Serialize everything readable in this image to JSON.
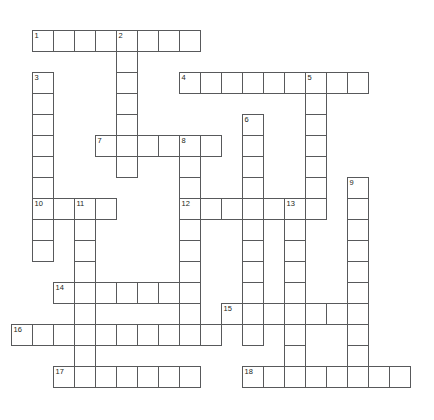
{
  "puzzle": {
    "type": "crossword-grid",
    "title": "",
    "cell_size_px": 22,
    "grid_origin": {
      "x": 11,
      "y": 9
    },
    "colors": {
      "cell_border": "#58595b",
      "cell_fill": "#ffffff",
      "number_text": "#231f20",
      "page_background": "#ffffff"
    },
    "entries": [
      {
        "number": "1",
        "direction": "across",
        "col": 1,
        "row": 1,
        "length": 8
      },
      {
        "number": "2",
        "direction": "down",
        "col": 5,
        "row": 1,
        "length": 8
      },
      {
        "number": "3",
        "direction": "down",
        "col": 1,
        "row": 3,
        "length": 7
      },
      {
        "number": "4",
        "direction": "across",
        "col": 8,
        "row": 3,
        "length": 9
      },
      {
        "number": "5",
        "direction": "down",
        "col": 14,
        "row": 3,
        "length": 7
      },
      {
        "number": "6",
        "direction": "down",
        "col": 11,
        "row": 5,
        "length": 10
      },
      {
        "number": "7",
        "direction": "across",
        "col": 4,
        "row": 6,
        "length": 6
      },
      {
        "number": "8",
        "direction": "down",
        "col": 8,
        "row": 6,
        "length": 9
      },
      {
        "number": "9",
        "direction": "down",
        "col": 16,
        "row": 8,
        "length": 9
      },
      {
        "number": "10",
        "direction": "across",
        "col": 1,
        "row": 9,
        "length": 4
      },
      {
        "number": "11",
        "direction": "down",
        "col": 3,
        "row": 9,
        "length": 9
      },
      {
        "number": "12",
        "direction": "across",
        "col": 8,
        "row": 9,
        "length": 6
      },
      {
        "number": "13",
        "direction": "down",
        "col": 13,
        "row": 9,
        "length": 7
      },
      {
        "number": "14",
        "direction": "across",
        "col": 2,
        "row": 13,
        "length": 7
      },
      {
        "number": "15",
        "direction": "across",
        "col": 10,
        "row": 14,
        "length": 7
      },
      {
        "number": "16",
        "direction": "across",
        "col": 0,
        "row": 15,
        "length": 10
      },
      {
        "number": "17",
        "direction": "across",
        "col": 2,
        "row": 17,
        "length": 7
      },
      {
        "number": "18",
        "direction": "across",
        "col": 11,
        "row": 17,
        "length": 8
      }
    ],
    "cells": [
      {
        "col": 1,
        "row": 1,
        "number": "1",
        "letter": ""
      },
      {
        "col": 2,
        "row": 1,
        "number": "",
        "letter": ""
      },
      {
        "col": 3,
        "row": 1,
        "number": "",
        "letter": ""
      },
      {
        "col": 4,
        "row": 1,
        "number": "",
        "letter": ""
      },
      {
        "col": 5,
        "row": 1,
        "number": "2",
        "letter": ""
      },
      {
        "col": 6,
        "row": 1,
        "number": "",
        "letter": ""
      },
      {
        "col": 7,
        "row": 1,
        "number": "",
        "letter": ""
      },
      {
        "col": 8,
        "row": 1,
        "number": "",
        "letter": ""
      },
      {
        "col": 5,
        "row": 2,
        "number": "",
        "letter": ""
      },
      {
        "col": 1,
        "row": 3,
        "number": "3",
        "letter": ""
      },
      {
        "col": 5,
        "row": 3,
        "number": "",
        "letter": ""
      },
      {
        "col": 8,
        "row": 3,
        "number": "4",
        "letter": ""
      },
      {
        "col": 9,
        "row": 3,
        "number": "",
        "letter": ""
      },
      {
        "col": 10,
        "row": 3,
        "number": "",
        "letter": ""
      },
      {
        "col": 11,
        "row": 3,
        "number": "",
        "letter": ""
      },
      {
        "col": 12,
        "row": 3,
        "number": "",
        "letter": ""
      },
      {
        "col": 13,
        "row": 3,
        "number": "",
        "letter": ""
      },
      {
        "col": 14,
        "row": 3,
        "number": "5",
        "letter": ""
      },
      {
        "col": 15,
        "row": 3,
        "number": "",
        "letter": ""
      },
      {
        "col": 16,
        "row": 3,
        "number": "",
        "letter": ""
      },
      {
        "col": 1,
        "row": 4,
        "number": "",
        "letter": ""
      },
      {
        "col": 5,
        "row": 4,
        "number": "",
        "letter": ""
      },
      {
        "col": 14,
        "row": 4,
        "number": "",
        "letter": ""
      },
      {
        "col": 1,
        "row": 5,
        "number": "",
        "letter": ""
      },
      {
        "col": 5,
        "row": 5,
        "number": "",
        "letter": ""
      },
      {
        "col": 11,
        "row": 5,
        "number": "6",
        "letter": ""
      },
      {
        "col": 14,
        "row": 5,
        "number": "",
        "letter": ""
      },
      {
        "col": 1,
        "row": 6,
        "number": "",
        "letter": ""
      },
      {
        "col": 4,
        "row": 6,
        "number": "7",
        "letter": ""
      },
      {
        "col": 5,
        "row": 6,
        "number": "",
        "letter": ""
      },
      {
        "col": 6,
        "row": 6,
        "number": "",
        "letter": ""
      },
      {
        "col": 7,
        "row": 6,
        "number": "",
        "letter": ""
      },
      {
        "col": 8,
        "row": 6,
        "number": "8",
        "letter": ""
      },
      {
        "col": 9,
        "row": 6,
        "number": "",
        "letter": ""
      },
      {
        "col": 11,
        "row": 6,
        "number": "",
        "letter": ""
      },
      {
        "col": 14,
        "row": 6,
        "number": "",
        "letter": ""
      },
      {
        "col": 1,
        "row": 7,
        "number": "",
        "letter": ""
      },
      {
        "col": 5,
        "row": 7,
        "number": "",
        "letter": ""
      },
      {
        "col": 8,
        "row": 7,
        "number": "",
        "letter": ""
      },
      {
        "col": 11,
        "row": 7,
        "number": "",
        "letter": ""
      },
      {
        "col": 14,
        "row": 7,
        "number": "",
        "letter": ""
      },
      {
        "col": 1,
        "row": 8,
        "number": "",
        "letter": ""
      },
      {
        "col": 8,
        "row": 8,
        "number": "",
        "letter": ""
      },
      {
        "col": 11,
        "row": 8,
        "number": "",
        "letter": ""
      },
      {
        "col": 14,
        "row": 8,
        "number": "",
        "letter": ""
      },
      {
        "col": 16,
        "row": 8,
        "number": "9",
        "letter": ""
      },
      {
        "col": 1,
        "row": 9,
        "number": "10",
        "letter": ""
      },
      {
        "col": 2,
        "row": 9,
        "number": "",
        "letter": ""
      },
      {
        "col": 3,
        "row": 9,
        "number": "11",
        "letter": ""
      },
      {
        "col": 4,
        "row": 9,
        "number": "",
        "letter": ""
      },
      {
        "col": 8,
        "row": 9,
        "number": "12",
        "letter": ""
      },
      {
        "col": 9,
        "row": 9,
        "number": "",
        "letter": ""
      },
      {
        "col": 10,
        "row": 9,
        "number": "",
        "letter": ""
      },
      {
        "col": 11,
        "row": 9,
        "number": "",
        "letter": ""
      },
      {
        "col": 12,
        "row": 9,
        "number": "",
        "letter": ""
      },
      {
        "col": 13,
        "row": 9,
        "number": "13",
        "letter": ""
      },
      {
        "col": 14,
        "row": 9,
        "number": "",
        "letter": ""
      },
      {
        "col": 16,
        "row": 9,
        "number": "",
        "letter": ""
      },
      {
        "col": 1,
        "row": 10,
        "number": "",
        "letter": ""
      },
      {
        "col": 3,
        "row": 10,
        "number": "",
        "letter": ""
      },
      {
        "col": 8,
        "row": 10,
        "number": "",
        "letter": ""
      },
      {
        "col": 11,
        "row": 10,
        "number": "",
        "letter": ""
      },
      {
        "col": 13,
        "row": 10,
        "number": "",
        "letter": ""
      },
      {
        "col": 16,
        "row": 10,
        "number": "",
        "letter": ""
      },
      {
        "col": 1,
        "row": 11,
        "number": "",
        "letter": ""
      },
      {
        "col": 3,
        "row": 11,
        "number": "",
        "letter": ""
      },
      {
        "col": 8,
        "row": 11,
        "number": "",
        "letter": ""
      },
      {
        "col": 11,
        "row": 11,
        "number": "",
        "letter": ""
      },
      {
        "col": 13,
        "row": 11,
        "number": "",
        "letter": ""
      },
      {
        "col": 16,
        "row": 11,
        "number": "",
        "letter": ""
      },
      {
        "col": 3,
        "row": 12,
        "number": "",
        "letter": ""
      },
      {
        "col": 8,
        "row": 12,
        "number": "",
        "letter": ""
      },
      {
        "col": 11,
        "row": 12,
        "number": "",
        "letter": ""
      },
      {
        "col": 13,
        "row": 12,
        "number": "",
        "letter": ""
      },
      {
        "col": 16,
        "row": 12,
        "number": "",
        "letter": ""
      },
      {
        "col": 2,
        "row": 13,
        "number": "14",
        "letter": ""
      },
      {
        "col": 3,
        "row": 13,
        "number": "",
        "letter": ""
      },
      {
        "col": 4,
        "row": 13,
        "number": "",
        "letter": ""
      },
      {
        "col": 5,
        "row": 13,
        "number": "",
        "letter": ""
      },
      {
        "col": 6,
        "row": 13,
        "number": "",
        "letter": ""
      },
      {
        "col": 7,
        "row": 13,
        "number": "",
        "letter": ""
      },
      {
        "col": 8,
        "row": 13,
        "number": "",
        "letter": ""
      },
      {
        "col": 11,
        "row": 13,
        "number": "",
        "letter": ""
      },
      {
        "col": 13,
        "row": 13,
        "number": "",
        "letter": ""
      },
      {
        "col": 16,
        "row": 13,
        "number": "",
        "letter": ""
      },
      {
        "col": 3,
        "row": 14,
        "number": "",
        "letter": ""
      },
      {
        "col": 8,
        "row": 14,
        "number": "",
        "letter": ""
      },
      {
        "col": 10,
        "row": 14,
        "number": "15",
        "letter": ""
      },
      {
        "col": 11,
        "row": 14,
        "number": "",
        "letter": ""
      },
      {
        "col": 12,
        "row": 14,
        "number": "",
        "letter": ""
      },
      {
        "col": 13,
        "row": 14,
        "number": "",
        "letter": ""
      },
      {
        "col": 14,
        "row": 14,
        "number": "",
        "letter": ""
      },
      {
        "col": 15,
        "row": 14,
        "number": "",
        "letter": ""
      },
      {
        "col": 16,
        "row": 14,
        "number": "",
        "letter": ""
      },
      {
        "col": 0,
        "row": 15,
        "number": "16",
        "letter": ""
      },
      {
        "col": 1,
        "row": 15,
        "number": "",
        "letter": ""
      },
      {
        "col": 2,
        "row": 15,
        "number": "",
        "letter": ""
      },
      {
        "col": 3,
        "row": 15,
        "number": "",
        "letter": ""
      },
      {
        "col": 4,
        "row": 15,
        "number": "",
        "letter": ""
      },
      {
        "col": 5,
        "row": 15,
        "number": "",
        "letter": ""
      },
      {
        "col": 6,
        "row": 15,
        "number": "",
        "letter": ""
      },
      {
        "col": 7,
        "row": 15,
        "number": "",
        "letter": ""
      },
      {
        "col": 8,
        "row": 15,
        "number": "",
        "letter": ""
      },
      {
        "col": 9,
        "row": 15,
        "number": "",
        "letter": ""
      },
      {
        "col": 11,
        "row": 15,
        "number": "",
        "letter": ""
      },
      {
        "col": 13,
        "row": 15,
        "number": "",
        "letter": ""
      },
      {
        "col": 16,
        "row": 15,
        "number": "",
        "letter": ""
      },
      {
        "col": 3,
        "row": 16,
        "number": "",
        "letter": ""
      },
      {
        "col": 13,
        "row": 16,
        "number": "",
        "letter": ""
      },
      {
        "col": 16,
        "row": 16,
        "number": "",
        "letter": ""
      },
      {
        "col": 2,
        "row": 17,
        "number": "17",
        "letter": ""
      },
      {
        "col": 3,
        "row": 17,
        "number": "",
        "letter": ""
      },
      {
        "col": 4,
        "row": 17,
        "number": "",
        "letter": ""
      },
      {
        "col": 5,
        "row": 17,
        "number": "",
        "letter": ""
      },
      {
        "col": 6,
        "row": 17,
        "number": "",
        "letter": ""
      },
      {
        "col": 7,
        "row": 17,
        "number": "",
        "letter": ""
      },
      {
        "col": 8,
        "row": 17,
        "number": "",
        "letter": ""
      },
      {
        "col": 11,
        "row": 17,
        "number": "18",
        "letter": ""
      },
      {
        "col": 12,
        "row": 17,
        "number": "",
        "letter": ""
      },
      {
        "col": 13,
        "row": 17,
        "number": "",
        "letter": ""
      },
      {
        "col": 14,
        "row": 17,
        "number": "",
        "letter": ""
      },
      {
        "col": 15,
        "row": 17,
        "number": "",
        "letter": ""
      },
      {
        "col": 16,
        "row": 17,
        "number": "",
        "letter": ""
      },
      {
        "col": 17,
        "row": 17,
        "number": "",
        "letter": ""
      },
      {
        "col": 18,
        "row": 17,
        "number": "",
        "letter": ""
      }
    ]
  }
}
